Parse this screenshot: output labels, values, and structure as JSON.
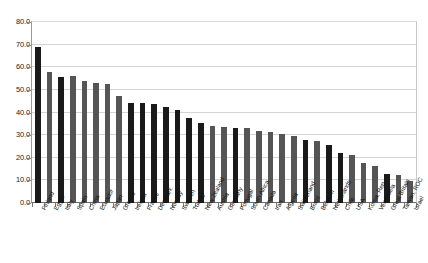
{
  "chart_data": {
    "type": "bar",
    "title": "",
    "subtitle": "",
    "xlabel": "",
    "ylabel": "",
    "ylim": [
      0,
      80
    ],
    "ytick_step": 10,
    "ytick_labels": [
      "80.0",
      "70.0",
      "60.0",
      "50.0",
      "40.0",
      "30.0",
      "20.0",
      "10.0",
      "0.0"
    ],
    "grid": true,
    "legend": "none",
    "bar_colors": {
      "dark": "#1a1a1a",
      "medium": "#555555"
    },
    "categories": [
      "Finland",
      "Egypt",
      "Italy",
      "Spain",
      "China",
      "Ecuador",
      "Japan",
      "Greece",
      "Ireland",
      "France",
      "Denmark",
      "Norway",
      "Sweden",
      "Turkey",
      "New Zealand",
      "Austria",
      "Germany",
      "Portugal",
      "South Africa",
      "Canada",
      "Iran",
      "Algeria",
      "Switzerland",
      "Brazil",
      "Belgium",
      "Netherlands",
      "Chile",
      "USA",
      "Korea, Rep.",
      "Venezuela",
      "Great Britain",
      "Taiwan, ROC",
      "Israel"
    ],
    "values": [
      69.0,
      57.8,
      55.8,
      56.2,
      54.0,
      53.2,
      52.6,
      47.4,
      44.4,
      44.0,
      43.6,
      42.6,
      41.0,
      37.4,
      35.2,
      34.2,
      33.4,
      33.2,
      33.2,
      31.8,
      31.4,
      30.6,
      29.8,
      28.0,
      27.4,
      25.8,
      22.2,
      21.2,
      17.6,
      16.4,
      12.8,
      12.2,
      9.6
    ],
    "series_shading": [
      "dark",
      "medium",
      "dark",
      "medium",
      "medium",
      "medium",
      "medium",
      "medium",
      "dark",
      "dark",
      "dark",
      "dark",
      "dark",
      "dark",
      "dark",
      "medium",
      "medium",
      "dark",
      "medium",
      "medium",
      "medium",
      "medium",
      "medium",
      "dark",
      "medium",
      "dark",
      "dark",
      "medium",
      "medium",
      "medium",
      "dark",
      "medium",
      "medium"
    ]
  }
}
